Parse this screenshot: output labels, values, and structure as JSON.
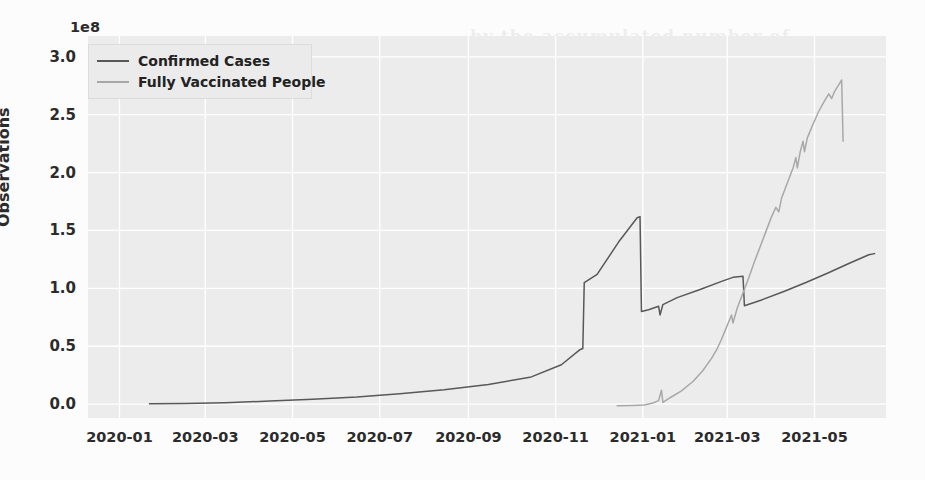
{
  "chart_data": {
    "type": "line",
    "title": "",
    "xlabel": "",
    "ylabel": "Observations",
    "y_offset_text": "1e8",
    "y_offset_factor": 100000000,
    "ylim": [
      -0.12,
      3.18
    ],
    "yticks": [
      "0.0",
      "0.5",
      "1.0",
      "1.5",
      "2.0",
      "2.5",
      "3.0"
    ],
    "ytick_values": [
      0.0,
      0.5,
      1.0,
      1.5,
      2.0,
      2.5,
      3.0
    ],
    "xticks": [
      "2020-01",
      "2020-03",
      "2020-05",
      "2020-07",
      "2020-09",
      "2020-11",
      "2021-01",
      "2021-03",
      "2021-05"
    ],
    "xlim": [
      "2019-12-10",
      "2021-06-20"
    ],
    "grid": true,
    "legend_position": "upper left",
    "series": [
      {
        "name": "Confirmed Cases",
        "color": "#585858",
        "points": [
          [
            "2020-01-22",
            0.003
          ],
          [
            "2020-02-15",
            0.006
          ],
          [
            "2020-03-15",
            0.012
          ],
          [
            "2020-04-15",
            0.026
          ],
          [
            "2020-05-15",
            0.042
          ],
          [
            "2020-06-15",
            0.062
          ],
          [
            "2020-07-15",
            0.09
          ],
          [
            "2020-08-15",
            0.125
          ],
          [
            "2020-09-15",
            0.17
          ],
          [
            "2020-10-15",
            0.235
          ],
          [
            "2020-11-05",
            0.34
          ],
          [
            "2020-11-18",
            0.47
          ],
          [
            "2020-11-20",
            0.48
          ],
          [
            "2020-11-21",
            1.05
          ],
          [
            "2020-11-30",
            1.12
          ],
          [
            "2020-12-15",
            1.4
          ],
          [
            "2020-12-28",
            1.61
          ],
          [
            "2020-12-30",
            1.62
          ],
          [
            "2020-12-31",
            0.8
          ],
          [
            "2021-01-05",
            0.815
          ],
          [
            "2021-01-12",
            0.845
          ],
          [
            "2021-01-13",
            0.77
          ],
          [
            "2021-01-15",
            0.86
          ],
          [
            "2021-01-25",
            0.92
          ],
          [
            "2021-02-10",
            0.99
          ],
          [
            "2021-02-25",
            1.06
          ],
          [
            "2021-03-05",
            1.095
          ],
          [
            "2021-03-12",
            1.105
          ],
          [
            "2021-03-13",
            0.85
          ],
          [
            "2021-03-25",
            0.9
          ],
          [
            "2021-04-10",
            0.975
          ],
          [
            "2021-04-25",
            1.05
          ],
          [
            "2021-05-10",
            1.13
          ],
          [
            "2021-05-25",
            1.215
          ],
          [
            "2021-06-08",
            1.29
          ],
          [
            "2021-06-12",
            1.3
          ]
        ]
      },
      {
        "name": "Fully Vaccinated People",
        "color": "#a8a8a8",
        "points": [
          [
            "2020-12-14",
            -0.015
          ],
          [
            "2020-12-25",
            -0.012
          ],
          [
            "2021-01-02",
            -0.008
          ],
          [
            "2021-01-08",
            0.01
          ],
          [
            "2021-01-12",
            0.03
          ],
          [
            "2021-01-14",
            0.12
          ],
          [
            "2021-01-15",
            0.015
          ],
          [
            "2021-01-20",
            0.055
          ],
          [
            "2021-01-28",
            0.115
          ],
          [
            "2021-02-05",
            0.195
          ],
          [
            "2021-02-12",
            0.29
          ],
          [
            "2021-02-18",
            0.395
          ],
          [
            "2021-02-22",
            0.48
          ],
          [
            "2021-02-25",
            0.56
          ],
          [
            "2021-03-01",
            0.68
          ],
          [
            "2021-03-04",
            0.77
          ],
          [
            "2021-03-05",
            0.7
          ],
          [
            "2021-03-08",
            0.83
          ],
          [
            "2021-03-12",
            0.96
          ],
          [
            "2021-03-16",
            1.09
          ],
          [
            "2021-03-20",
            1.23
          ],
          [
            "2021-03-24",
            1.36
          ],
          [
            "2021-03-28",
            1.49
          ],
          [
            "2021-04-01",
            1.62
          ],
          [
            "2021-04-04",
            1.7
          ],
          [
            "2021-04-06",
            1.66
          ],
          [
            "2021-04-08",
            1.78
          ],
          [
            "2021-04-12",
            1.91
          ],
          [
            "2021-04-16",
            2.04
          ],
          [
            "2021-04-18",
            2.13
          ],
          [
            "2021-04-19",
            2.04
          ],
          [
            "2021-04-21",
            2.18
          ],
          [
            "2021-04-23",
            2.27
          ],
          [
            "2021-04-24",
            2.18
          ],
          [
            "2021-04-26",
            2.3
          ],
          [
            "2021-04-30",
            2.42
          ],
          [
            "2021-05-04",
            2.53
          ],
          [
            "2021-05-08",
            2.62
          ],
          [
            "2021-05-11",
            2.68
          ],
          [
            "2021-05-13",
            2.64
          ],
          [
            "2021-05-15",
            2.7
          ],
          [
            "2021-05-18",
            2.76
          ],
          [
            "2021-05-20",
            2.8
          ],
          [
            "2021-05-21",
            2.27
          ]
        ]
      }
    ]
  },
  "legend": {
    "items": [
      {
        "label": "Confirmed Cases",
        "color": "#585858"
      },
      {
        "label": "Fully Vaccinated People",
        "color": "#a8a8a8"
      }
    ]
  },
  "background_artifacts": [
    {
      "text": "by the accumulated number of",
      "x": 470,
      "y": 26,
      "size": 17
    },
    {
      "text": "which any known number of cases",
      "x": 148,
      "y": 62,
      "size": 19
    },
    {
      "text": "and the",
      "x": 600,
      "y": 62,
      "size": 19
    },
    {
      "text": "... observed in the raw infection data; and",
      "x": 120,
      "y": 96,
      "size": 19
    },
    {
      "text": "the non-stationary effect that the accumulated variable",
      "x": 130,
      "y": 130,
      "size": 19
    },
    {
      "text": "as one of the leading factors for the infection rate variation",
      "x": 120,
      "y": 163,
      "size": 19
    },
    {
      "text": "in the standard linear regression.",
      "x": 150,
      "y": 196,
      "size": 19
    },
    {
      "text": "Vaccinated",
      "x": 320,
      "y": 300,
      "size": 9
    },
    {
      "text": "Confirmed",
      "x": 400,
      "y": 296,
      "size": 9
    }
  ]
}
